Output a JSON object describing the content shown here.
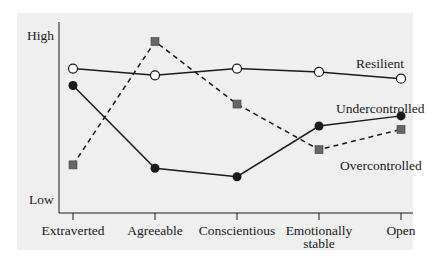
{
  "chart_data": {
    "type": "line",
    "title": "",
    "xlabel": "",
    "ylabel": "",
    "y_axis_labels": {
      "high": "High",
      "low": "Low"
    },
    "categories": [
      "Extraverted",
      "Agreeable",
      "Conscientious",
      "Emotionally stable",
      "Open"
    ],
    "category_lines": [
      [
        "Extraverted"
      ],
      [
        "Agreeable"
      ],
      [
        "Conscientious"
      ],
      [
        "Emotionally",
        "stable"
      ],
      [
        "Open"
      ]
    ],
    "ylim": [
      0,
      100
    ],
    "grid": false,
    "legend": "inline labels near series ends",
    "series": [
      {
        "name": "Resilient",
        "marker": "open-circle",
        "line": "solid",
        "values": [
          76,
          72,
          76,
          74,
          70
        ]
      },
      {
        "name": "Undercontrolled",
        "marker": "filled-circle",
        "line": "solid",
        "values": [
          66,
          17,
          12,
          42,
          48
        ]
      },
      {
        "name": "Overcontrolled",
        "marker": "gray-square",
        "line": "dashed",
        "values": [
          19,
          92,
          55,
          28,
          40
        ]
      }
    ]
  },
  "colors": {
    "background_panel": "#efefef",
    "line": "#1a1a1a",
    "square_marker": "#666666"
  }
}
